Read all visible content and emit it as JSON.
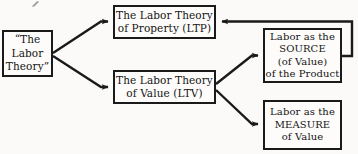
{
  "diagram": {
    "background_color": "#fbfaf8",
    "stroke_color": "#1a1a1a",
    "nodes": [
      {
        "id": "root",
        "lines": [
          "“The",
          "Labor",
          "Theory”"
        ]
      },
      {
        "id": "ltp",
        "lines": [
          "The Labor Theory",
          "of Property (LTP)"
        ]
      },
      {
        "id": "ltv",
        "lines": [
          "The Labor Theory",
          "of  Value  (LTV)"
        ]
      },
      {
        "id": "source",
        "lines": [
          "Labor as the",
          "SOURCE",
          "(of  Value)",
          "of the Product"
        ]
      },
      {
        "id": "measure",
        "lines": [
          "Labor as the",
          "MEASURE",
          "of  Value"
        ]
      }
    ],
    "edges": [
      {
        "id": "root-to-ltp",
        "from": "root",
        "to": "ltp",
        "arrow": "to"
      },
      {
        "id": "root-to-ltv",
        "from": "root",
        "to": "ltv",
        "arrow": "to"
      },
      {
        "id": "ltv-to-source",
        "from": "ltv",
        "to": "source",
        "arrow": "to"
      },
      {
        "id": "ltv-to-measure",
        "from": "ltv",
        "to": "measure",
        "arrow": "to"
      },
      {
        "id": "source-to-ltp",
        "from": "source",
        "to": "ltp",
        "arrow": "to"
      }
    ]
  }
}
